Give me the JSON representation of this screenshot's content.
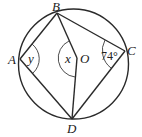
{
  "diagram": {
    "type": "circle-geometry",
    "circle": {
      "center_label": "O"
    },
    "points": {
      "A": "A",
      "B": "B",
      "C": "C",
      "D": "D",
      "O": "O"
    },
    "angles": {
      "at_A": "y",
      "at_O": "x",
      "at_C": "74°"
    },
    "segments": [
      "AB",
      "BC",
      "CD",
      "DA",
      "BO",
      "OD"
    ],
    "colors": {
      "stroke": "#2a2a2a",
      "background": "#ffffff"
    }
  }
}
